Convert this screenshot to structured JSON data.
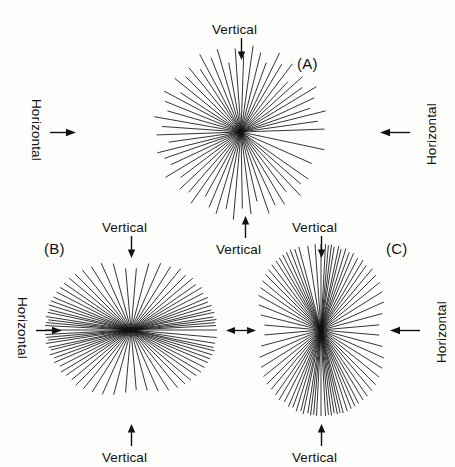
{
  "figure": {
    "background_color": "#fdfdfb",
    "ray_color": "#111111",
    "width": 455,
    "height": 467
  },
  "panels": [
    {
      "key": "A",
      "label": "(A)",
      "label_x": 297,
      "label_y": 55,
      "center_x": 241,
      "center_y": 132,
      "radius": 88,
      "distribution": "isotropic",
      "description": "Rays distributed nearly uniformly in all directions"
    },
    {
      "key": "B",
      "label": "(B)",
      "label_x": 44,
      "label_y": 240,
      "center_x": 131,
      "center_y": 330,
      "radius": 86,
      "distribution": "horizontal",
      "description": "Rays strongly concentrated about the horizontal axis"
    },
    {
      "key": "C",
      "label": "(C)",
      "label_x": 386,
      "label_y": 240,
      "center_x": 321,
      "center_y": 330,
      "radius": 86,
      "distribution": "vertical",
      "description": "Rays strongly concentrated about the vertical axis"
    }
  ],
  "annotations": [
    {
      "name": "vertical-top-a",
      "text": "Vertical",
      "x": 241,
      "y": 22,
      "orientation": "horizontal",
      "arrow": "down"
    },
    {
      "name": "horizontal-left-a",
      "text": "Horizontal",
      "x": 36,
      "y": 132,
      "orientation": "rotate-cw",
      "arrow": "right"
    },
    {
      "name": "horizontal-right-a",
      "text": "Horizontal",
      "x": 424,
      "y": 132,
      "orientation": "rotate-ccw",
      "arrow": "left"
    },
    {
      "name": "vertical-bottom-a",
      "text": "Vertical",
      "x": 245,
      "y": 242,
      "orientation": "horizontal",
      "arrow": "up"
    },
    {
      "name": "vertical-top-b",
      "text": "Vertical",
      "x": 131,
      "y": 220,
      "orientation": "horizontal",
      "arrow": "down"
    },
    {
      "name": "horizontal-left-b",
      "text": "Horizontal",
      "x": 22,
      "y": 330,
      "orientation": "rotate-cw",
      "arrow": "right"
    },
    {
      "name": "vertical-bottom-b",
      "text": "Vertical",
      "x": 131,
      "y": 450,
      "orientation": "horizontal",
      "arrow": "up"
    },
    {
      "name": "vertical-top-c",
      "text": "Vertical",
      "x": 321,
      "y": 220,
      "orientation": "horizontal",
      "arrow": "down"
    },
    {
      "name": "horizontal-right-c",
      "text": "Horizontal",
      "x": 434,
      "y": 330,
      "orientation": "rotate-ccw",
      "arrow": "left"
    },
    {
      "name": "vertical-bottom-c",
      "text": "Vertical",
      "x": 321,
      "y": 450,
      "orientation": "horizontal",
      "arrow": "up"
    },
    {
      "name": "horizontal-shared-bc",
      "text": "",
      "x": 226,
      "y": 330,
      "orientation": "horizontal",
      "arrow": "double"
    }
  ],
  "chart_data": {
    "type": "rose",
    "panel_count": 3,
    "panels": [
      {
        "key": "A",
        "label": "(A)",
        "pattern": "isotropic",
        "ray_count": 58,
        "angles_deg": [
          2,
          8,
          14,
          19,
          25,
          31,
          36,
          42,
          47,
          53,
          59,
          64,
          70,
          76,
          82,
          88,
          94,
          100,
          106,
          112,
          118,
          123,
          129,
          135,
          141,
          147,
          152,
          158,
          164,
          170,
          176,
          182,
          188,
          194,
          199,
          205,
          211,
          217,
          223,
          229,
          235,
          241,
          247,
          253,
          259,
          265,
          271,
          277,
          283,
          289,
          295,
          301,
          307,
          313,
          319,
          325,
          336,
          348
        ],
        "lengths_norm": [
          0.95,
          0.88,
          0.99,
          0.83,
          0.92,
          1.0,
          0.86,
          0.94,
          0.78,
          0.97,
          0.9,
          1.0,
          0.84,
          0.93,
          0.99,
          0.87,
          0.95,
          0.8,
          0.98,
          0.91,
          1.0,
          0.85,
          0.94,
          0.89,
          0.97,
          0.82,
          0.99,
          0.93,
          0.87,
          1.0,
          0.9,
          0.96,
          0.83,
          0.98,
          0.92,
          0.88,
          1.0,
          0.86,
          0.95,
          0.91,
          0.99,
          0.84,
          0.93,
          0.97,
          0.89,
          1.0,
          0.87,
          0.94,
          0.81,
          0.98,
          0.92,
          0.96,
          0.85,
          0.99,
          0.9,
          0.93,
          0.88,
          0.97
        ]
      },
      {
        "key": "B",
        "label": "(B)",
        "pattern": "horizontal-preferred",
        "ray_count": 76,
        "angles_deg": [
          0,
          3,
          5,
          7,
          9,
          12,
          14,
          17,
          20,
          23,
          27,
          31,
          35,
          40,
          45,
          51,
          58,
          66,
          75,
          85,
          95,
          105,
          114,
          122,
          129,
          135,
          140,
          145,
          149,
          153,
          157,
          160,
          163,
          166,
          168,
          171,
          173,
          175,
          177,
          180,
          183,
          185,
          187,
          189,
          192,
          194,
          197,
          200,
          203,
          207,
          211,
          215,
          220,
          225,
          231,
          238,
          246,
          255,
          265,
          275,
          285,
          294,
          302,
          309,
          315,
          320,
          325,
          329,
          333,
          337,
          340,
          343,
          346,
          348,
          351,
          355
        ],
        "lengths_norm": [
          1.0,
          0.99,
          0.98,
          1.0,
          0.97,
          0.99,
          0.96,
          0.98,
          0.95,
          0.97,
          0.94,
          0.96,
          0.92,
          0.94,
          0.9,
          0.92,
          0.87,
          0.85,
          0.8,
          0.72,
          0.72,
          0.8,
          0.85,
          0.87,
          0.9,
          0.92,
          0.94,
          0.95,
          0.96,
          0.97,
          0.98,
          0.99,
          1.0,
          0.98,
          0.99,
          1.0,
          0.97,
          0.99,
          1.0,
          1.0,
          1.0,
          0.99,
          0.97,
          1.0,
          0.98,
          0.96,
          0.99,
          0.95,
          0.97,
          0.93,
          0.95,
          0.92,
          0.9,
          0.91,
          0.88,
          0.85,
          0.82,
          0.78,
          0.73,
          0.7,
          0.73,
          0.78,
          0.83,
          0.86,
          0.89,
          0.91,
          0.93,
          0.95,
          0.96,
          0.97,
          0.98,
          0.99,
          1.0,
          0.98,
          0.99,
          1.0
        ]
      },
      {
        "key": "C",
        "label": "(C)",
        "pattern": "vertical-preferred",
        "ray_count": 78,
        "angles_deg": [
          90,
          87,
          85,
          83,
          81,
          78,
          76,
          73,
          70,
          67,
          63,
          59,
          55,
          50,
          45,
          39,
          32,
          24,
          15,
          5,
          355,
          345,
          336,
          328,
          321,
          315,
          310,
          305,
          301,
          297,
          294,
          291,
          288,
          285,
          283,
          281,
          279,
          277,
          275,
          273,
          270,
          267,
          265,
          263,
          261,
          258,
          256,
          253,
          250,
          247,
          243,
          239,
          235,
          230,
          225,
          219,
          212,
          204,
          195,
          185,
          175,
          166,
          158,
          151,
          145,
          140,
          135,
          131,
          127,
          123,
          120,
          117,
          114,
          111,
          108,
          105,
          99,
          94
        ],
        "lengths_norm": [
          1.0,
          1.0,
          0.99,
          1.0,
          0.98,
          1.0,
          0.97,
          0.99,
          0.96,
          0.97,
          0.94,
          0.95,
          0.92,
          0.93,
          0.9,
          0.88,
          0.84,
          0.8,
          0.74,
          0.68,
          0.68,
          0.74,
          0.8,
          0.84,
          0.87,
          0.9,
          0.92,
          0.94,
          0.95,
          0.96,
          0.97,
          0.98,
          0.99,
          1.0,
          0.99,
          1.0,
          0.98,
          1.0,
          0.99,
          1.0,
          1.0,
          1.0,
          0.99,
          1.0,
          0.98,
          1.0,
          0.97,
          0.99,
          0.96,
          0.97,
          0.94,
          0.95,
          0.92,
          0.9,
          0.89,
          0.86,
          0.82,
          0.78,
          0.72,
          0.66,
          0.66,
          0.72,
          0.78,
          0.83,
          0.86,
          0.89,
          0.91,
          0.93,
          0.95,
          0.96,
          0.97,
          0.98,
          0.99,
          1.0,
          0.99,
          1.0,
          0.99,
          1.0
        ]
      }
    ]
  }
}
